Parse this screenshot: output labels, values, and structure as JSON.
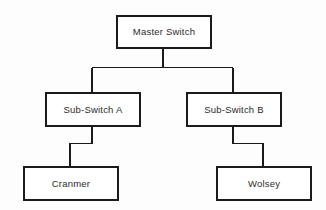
{
  "diagram": {
    "background_color": "#fdfdfd",
    "line_color": "#1b1b1b",
    "text_color": "#2b2b2b",
    "nodes": [
      {
        "id": "master",
        "label": "Master Switch"
      },
      {
        "id": "sub_a",
        "label": "Sub-Switch A"
      },
      {
        "id": "sub_b",
        "label": "Sub-Switch B"
      },
      {
        "id": "cranmer",
        "label": "Cranmer"
      },
      {
        "id": "wolsey",
        "label": "Wolsey"
      }
    ],
    "edges": [
      {
        "from": "master",
        "to": "sub_a",
        "style": "orthogonal"
      },
      {
        "from": "master",
        "to": "sub_b",
        "style": "orthogonal"
      },
      {
        "from": "sub_a",
        "to": "cranmer",
        "style": "stepped"
      },
      {
        "from": "sub_b",
        "to": "wolsey",
        "style": "stepped"
      }
    ]
  }
}
